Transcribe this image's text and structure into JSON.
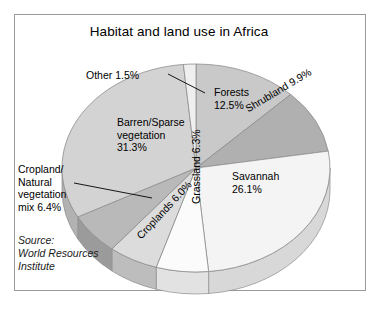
{
  "figure": {
    "title": "Habitat and land use in Africa",
    "source_note": "Source:\nWorld Resources\nInstitute",
    "frame_color": "#9a9a9a",
    "background": "#ffffff"
  },
  "labels": {
    "other": "Other 1.5%",
    "forests": "Forests\n12.5%",
    "shrubland": "Shrubland\n9.9%",
    "savannah": "Savannah\n26.1%",
    "grassland": "Grassland\n6.3%",
    "croplands": "Croplands 6.0%",
    "barren": "Barren/Sparse\nvegetation\n31.3%",
    "cropmix": "Cropland/\nNatural\nvegetation\nmix 6.4%"
  },
  "chart_data": {
    "type": "pie",
    "title": "Habitat and land use in Africa",
    "unit": "percent",
    "total": 100.0,
    "three_d": true,
    "start_angle_deg": -90,
    "direction": "clockwise",
    "legend": "none (labels placed on/around slices)",
    "source": "World Resources Institute",
    "categories": [
      "Forests",
      "Shrubland",
      "Savannah",
      "Grassland",
      "Croplands",
      "Cropland/Natural vegetation mix",
      "Barren/Sparse vegetation",
      "Other"
    ],
    "values": [
      12.5,
      9.9,
      26.1,
      6.3,
      6.0,
      6.4,
      31.3,
      1.5
    ],
    "slices": [
      {
        "name": "Forests",
        "value": 12.5,
        "label": "Forests 12.5%",
        "color": "#c9c9c9",
        "side_color": "#a8a8a8"
      },
      {
        "name": "Shrubland",
        "value": 9.9,
        "label": "Shrubland 9.9%",
        "color": "#b0b0b0",
        "side_color": "#8f8f8f"
      },
      {
        "name": "Savannah",
        "value": 26.1,
        "label": "Savannah 26.1%",
        "color": "#f4f4f4",
        "side_color": "#d8d8d8"
      },
      {
        "name": "Grassland",
        "value": 6.3,
        "label": "Grassland 6.3%",
        "color": "#fbfbfb",
        "side_color": "#e2e2e2"
      },
      {
        "name": "Croplands",
        "value": 6.0,
        "label": "Croplands 6.0%",
        "color": "#dcdcdc",
        "side_color": "#bdbdbd"
      },
      {
        "name": "Cropland/Natural vegetation mix",
        "value": 6.4,
        "label": "Cropland/Natural vegetation mix 6.4%",
        "color": "#b9b9b9",
        "side_color": "#9b9b9b"
      },
      {
        "name": "Barren/Sparse vegetation",
        "value": 31.3,
        "label": "Barren/Sparse vegetation 31.3%",
        "color": "#d3d3d3",
        "side_color": "#b2b2b2"
      },
      {
        "name": "Other",
        "value": 1.5,
        "label": "Other 1.5%",
        "color": "#efefef",
        "side_color": "#cfcfcf"
      }
    ],
    "leader_lines": [
      {
        "for": "Other",
        "from": [
          168,
          74
        ],
        "to": [
          205,
          93
        ]
      },
      {
        "for": "Cropland/Natural vegetation mix",
        "from": [
          74,
          183
        ],
        "to": [
          152,
          198
        ]
      }
    ]
  }
}
